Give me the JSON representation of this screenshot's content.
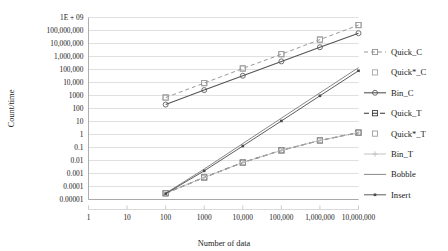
{
  "chart_data": {
    "type": "line",
    "title": "",
    "xlabel": "Number of data",
    "ylabel": "Count/time",
    "xscale": "log",
    "yscale": "log",
    "xlim": [
      1,
      10000000
    ],
    "ylim": [
      1e-05,
      1000000000
    ],
    "grid": true,
    "legend_position": "right",
    "xticks": [
      "1",
      "10",
      "100",
      "1000",
      "10,000",
      "100,000",
      "1,000,000",
      "10,000,000"
    ],
    "xtick_values": [
      1,
      10,
      100,
      1000,
      10000,
      100000,
      1000000,
      10000000
    ],
    "yticks": [
      "1E + 09",
      "100,000,000",
      "10,000,000",
      "1,000,000",
      "100,000",
      "10,000",
      "1000",
      "100",
      "10",
      "1",
      "0.1",
      "0.01",
      "0.001",
      "0.0001",
      "0.00001"
    ],
    "ytick_values": [
      1000000000,
      100000000,
      10000000,
      1000000,
      100000,
      10000,
      1000,
      100,
      10,
      1,
      0.1,
      0.01,
      0.001,
      0.0001,
      1e-05
    ],
    "x": [
      100,
      1000,
      10000,
      100000,
      1000000,
      10000000
    ],
    "series": [
      {
        "name": "Quick_C",
        "color": "#8c8c8c",
        "dash": "4,3",
        "marker": "square",
        "width": 0.9,
        "values": [
          700,
          9000,
          120000,
          1500000,
          20000000,
          260000000
        ]
      },
      {
        "name": "Quick*_C",
        "color": "#a0a0a0",
        "dash": "none",
        "marker": "square",
        "width": 0,
        "values": [
          700,
          9000,
          120000,
          1500000,
          20000000,
          260000000
        ]
      },
      {
        "name": "Bin_C",
        "color": "#555555",
        "dash": "none",
        "marker": "circle",
        "width": 1.1,
        "values": [
          200,
          2600,
          33000,
          420000,
          5200000,
          62000000
        ]
      },
      {
        "name": "Quick_T",
        "color": "#333333",
        "dash": "5,3",
        "marker": "square",
        "width": 1.1,
        "values": [
          3e-05,
          0.0005,
          0.007,
          0.06,
          0.35,
          1.4
        ]
      },
      {
        "name": "Quick*_T",
        "color": "#9a9a9a",
        "dash": "none",
        "marker": "square",
        "width": 0,
        "values": [
          3e-05,
          0.0005,
          0.007,
          0.06,
          0.35,
          1.4
        ]
      },
      {
        "name": "Bin_T",
        "color": "#bdbdbd",
        "dash": "none",
        "marker": "plus",
        "width": 0.9,
        "values": [
          3e-05,
          0.0005,
          0.007,
          0.06,
          0.35,
          1.4
        ]
      },
      {
        "name": "Bobble",
        "color": "#7a7a7a",
        "dash": "none",
        "marker": "none",
        "width": 0.9,
        "values": [
          3e-05,
          0.0022,
          0.2,
          18,
          1600,
          140000
        ]
      },
      {
        "name": "Insert",
        "color": "#4a4a4a",
        "dash": "none",
        "marker": "dot",
        "width": 0.9,
        "values": [
          2.8e-05,
          0.0016,
          0.13,
          11,
          950,
          80000
        ]
      }
    ]
  },
  "legend": {
    "items": [
      {
        "label": "Quick_C"
      },
      {
        "label": "Quick*_C"
      },
      {
        "label": "Bin_C"
      },
      {
        "label": "Quick_T"
      },
      {
        "label": "Quick*_T"
      },
      {
        "label": "Bin_T"
      },
      {
        "label": "Bobble"
      },
      {
        "label": "Insert"
      }
    ]
  },
  "axes": {
    "x_title": "Number of data",
    "y_title": "Count/time"
  }
}
